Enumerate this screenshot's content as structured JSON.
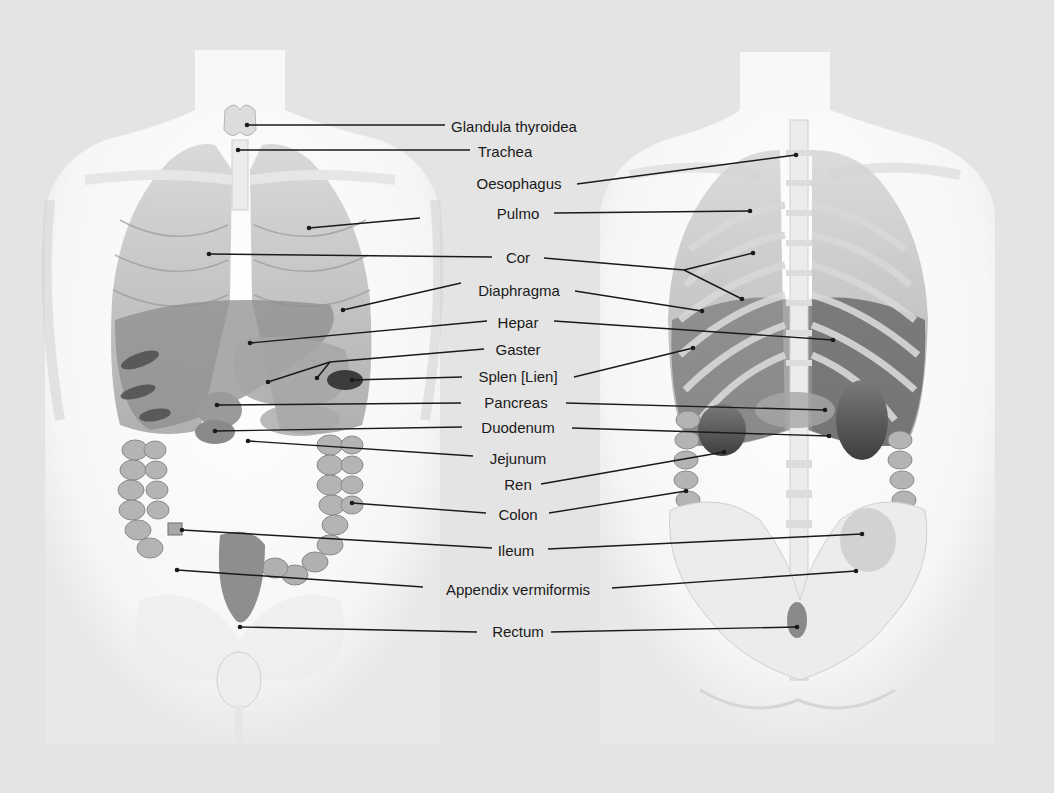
{
  "diagram": {
    "type": "anatomical-illustration",
    "views": [
      {
        "id": "anterior",
        "name": "Anterior view (front)"
      },
      {
        "id": "posterior",
        "name": "Posterior view (back)"
      }
    ],
    "colors": {
      "background": "#e4e4e4",
      "body": "#fafafa",
      "organ_light": "#b8b8b8",
      "organ_mid": "#8a8a8a",
      "organ_dark": "#4a4a4a",
      "line": "#1a1a1a",
      "text": "#1a1a1a"
    },
    "labels": [
      {
        "text": "Glandula thyroidea",
        "x": 514,
        "y": 126
      },
      {
        "text": "Trachea",
        "x": 505,
        "y": 151
      },
      {
        "text": "Oesophagus",
        "x": 519,
        "y": 183
      },
      {
        "text": "Pulmo",
        "x": 518,
        "y": 213
      },
      {
        "text": "Cor",
        "x": 518,
        "y": 257
      },
      {
        "text": "Diaphragma",
        "x": 519,
        "y": 290
      },
      {
        "text": "Hepar",
        "x": 518,
        "y": 322
      },
      {
        "text": "Gaster",
        "x": 518,
        "y": 349
      },
      {
        "text": "Splen [Lien]",
        "x": 518,
        "y": 376
      },
      {
        "text": "Pancreas",
        "x": 516,
        "y": 402
      },
      {
        "text": "Duodenum",
        "x": 518,
        "y": 427
      },
      {
        "text": "Jejunum",
        "x": 518,
        "y": 458
      },
      {
        "text": "Ren",
        "x": 518,
        "y": 484
      },
      {
        "text": "Colon",
        "x": 518,
        "y": 514
      },
      {
        "text": "Ileum",
        "x": 516,
        "y": 550
      },
      {
        "text": "Appendix vermiformis",
        "x": 518,
        "y": 589
      },
      {
        "text": "Rectum",
        "x": 518,
        "y": 631
      }
    ],
    "leaders": [
      {
        "label": "Glandula thyroidea",
        "from": [
          445,
          125
        ],
        "to": [
          247,
          125
        ]
      },
      {
        "label": "Trachea",
        "from": [
          470,
          150
        ],
        "to": [
          238,
          150
        ]
      },
      {
        "label": "Oesophagus",
        "from": [
          577,
          184
        ],
        "to": [
          796,
          155
        ]
      },
      {
        "label": "Pulmo",
        "from": [
          420,
          218
        ],
        "to": [
          309,
          228
        ]
      },
      {
        "label": "Pulmo",
        "from": [
          554,
          213
        ],
        "to": [
          750,
          211
        ]
      },
      {
        "label": "Cor",
        "from": [
          492,
          257
        ],
        "to": [
          209,
          254
        ]
      },
      {
        "label": "Cor",
        "from": [
          544,
          258
        ],
        "to": [
          684,
          270
        ]
      },
      {
        "label": "Cor",
        "from": [
          684,
          270
        ],
        "to": [
          753,
          253
        ]
      },
      {
        "label": "Cor",
        "from": [
          684,
          270
        ],
        "to": [
          742,
          299
        ]
      },
      {
        "label": "Diaphragma",
        "from": [
          461,
          283
        ],
        "to": [
          343,
          310
        ]
      },
      {
        "label": "Diaphragma",
        "from": [
          575,
          291
        ],
        "to": [
          702,
          311
        ]
      },
      {
        "label": "Hepar",
        "from": [
          487,
          321
        ],
        "to": [
          250,
          343
        ]
      },
      {
        "label": "Hepar",
        "from": [
          554,
          321
        ],
        "to": [
          833,
          340
        ]
      },
      {
        "label": "Gaster",
        "from": [
          484,
          349
        ],
        "to": [
          330,
          362
        ]
      },
      {
        "label": "Gaster",
        "from": [
          330,
          362
        ],
        "to": [
          268,
          382
        ]
      },
      {
        "label": "Gaster",
        "from": [
          330,
          362
        ],
        "to": [
          317,
          378
        ]
      },
      {
        "label": "Splen [Lien]",
        "from": [
          462,
          377
        ],
        "to": [
          352,
          380
        ]
      },
      {
        "label": "Splen [Lien]",
        "from": [
          574,
          377
        ],
        "to": [
          693,
          348
        ]
      },
      {
        "label": "Pancreas",
        "from": [
          461,
          403
        ],
        "to": [
          217,
          405
        ]
      },
      {
        "label": "Pancreas",
        "from": [
          566,
          403
        ],
        "to": [
          825,
          410
        ]
      },
      {
        "label": "Duodenum",
        "from": [
          462,
          427
        ],
        "to": [
          215,
          431
        ]
      },
      {
        "label": "Duodenum",
        "from": [
          572,
          428
        ],
        "to": [
          829,
          436
        ]
      },
      {
        "label": "Jejunum",
        "from": [
          473,
          456
        ],
        "to": [
          248,
          441
        ]
      },
      {
        "label": "Ren",
        "from": [
          541,
          484
        ],
        "to": [
          724,
          452
        ]
      },
      {
        "label": "Colon",
        "from": [
          486,
          513
        ],
        "to": [
          352,
          503
        ]
      },
      {
        "label": "Colon",
        "from": [
          549,
          513
        ],
        "to": [
          686,
          491
        ]
      },
      {
        "label": "Ileum",
        "from": [
          492,
          548
        ],
        "to": [
          182,
          530
        ]
      },
      {
        "label": "Ileum",
        "from": [
          548,
          549
        ],
        "to": [
          862,
          534
        ]
      },
      {
        "label": "Appendix vermiformis",
        "from": [
          423,
          587
        ],
        "to": [
          177,
          570
        ]
      },
      {
        "label": "Appendix vermiformis",
        "from": [
          612,
          588
        ],
        "to": [
          856,
          571
        ]
      },
      {
        "label": "Rectum",
        "from": [
          477,
          632
        ],
        "to": [
          240,
          627
        ]
      },
      {
        "label": "Rectum",
        "from": [
          551,
          632
        ],
        "to": [
          797,
          627
        ]
      }
    ]
  }
}
